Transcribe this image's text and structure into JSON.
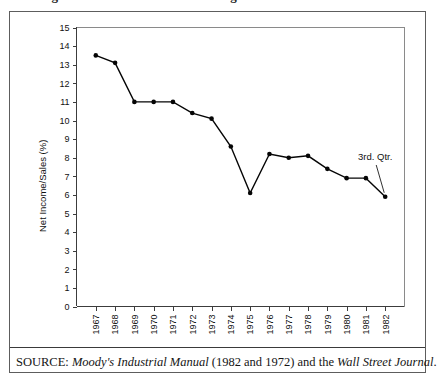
{
  "figure": {
    "clipped_caption": "Figure 1    Net Income as a Percentage of Sales",
    "source_prefix": "SOURCE:",
    "source_italic_1": "Moody's Industrial Manual",
    "source_middle": "(1982 and 1972) and the",
    "source_italic_2": "Wall Street Journal",
    "source_suffix": "."
  },
  "annotations": [
    {
      "name": "third-quarter-note",
      "text": "3rd. Qtr.",
      "target_year": "1982"
    }
  ],
  "chart_data": {
    "type": "line",
    "title": "",
    "xlabel": "",
    "ylabel": "Net Income/Sales (%)",
    "x": [
      "1967",
      "1968",
      "1969",
      "1970",
      "1971",
      "1972",
      "1973",
      "1974",
      "1975",
      "1976",
      "1977",
      "1978",
      "1979",
      "1980",
      "1981",
      "1982"
    ],
    "values": [
      13.5,
      13.1,
      11.0,
      11.0,
      11.0,
      10.4,
      10.1,
      8.6,
      6.1,
      8.2,
      8.0,
      8.1,
      7.4,
      6.9,
      6.9,
      5.9
    ],
    "yticks": [
      0,
      1,
      2,
      3,
      4,
      5,
      6,
      7,
      8,
      9,
      10,
      11,
      12,
      13,
      14,
      15
    ],
    "ylim": [
      0,
      15
    ],
    "grid": false,
    "legend": "none",
    "marker": "filled-circle",
    "line_color": "#050505"
  }
}
